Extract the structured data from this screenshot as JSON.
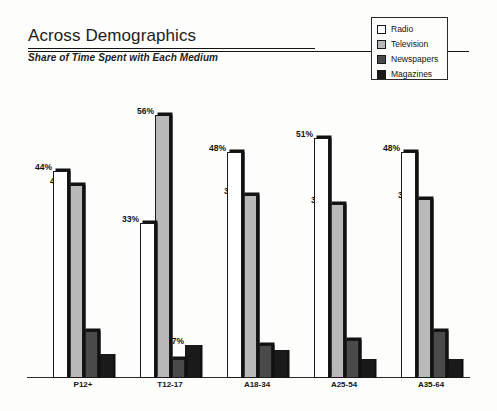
{
  "header": {
    "title": "Across Demographics",
    "subtitle": "Share of Time Spent with Each Medium"
  },
  "legend": {
    "position": "top-right",
    "items": [
      {
        "label": "Radio",
        "color": "#ffffff",
        "name": "legend-swatch-radio"
      },
      {
        "label": "Television",
        "color": "#b9b9b9",
        "name": "legend-swatch-television"
      },
      {
        "label": "Newspapers",
        "color": "#4a4a4a",
        "name": "legend-swatch-newspapers"
      },
      {
        "label": "Magazines",
        "color": "#1a1a1a",
        "name": "legend-swatch-magazines"
      }
    ]
  },
  "chart_data": {
    "type": "bar",
    "title": "Across Demographics",
    "subtitle": "Share of Time Spent with Each Medium",
    "xlabel": "",
    "ylabel": "",
    "ylim": [
      0,
      60
    ],
    "grid": false,
    "legend_position": "top-right",
    "value_suffix": "%",
    "categories": [
      "P12+",
      "T12-17",
      "A18-34",
      "A25-54",
      "A35-64"
    ],
    "series": [
      {
        "name": "Radio",
        "color": "#ffffff",
        "values": [
          44,
          33,
          48,
          51,
          48
        ],
        "labels": [
          "44%",
          "33%",
          "48%",
          "51%",
          "48%"
        ]
      },
      {
        "name": "Television",
        "color": "#b9b9b9",
        "values": [
          41,
          56,
          39,
          37,
          38
        ],
        "labels": [
          "41%",
          "56%",
          "39%",
          "37%",
          "38%"
        ]
      },
      {
        "name": "Newspapers",
        "color": "#4a4a4a",
        "values": [
          10,
          4,
          7,
          8,
          10
        ],
        "labels": [
          "10%",
          "4%",
          "7%",
          "8%",
          "10%"
        ]
      },
      {
        "name": "Magazines",
        "color": "#1a1a1a",
        "values": [
          5,
          7,
          6,
          4,
          4
        ],
        "labels": [
          "5%",
          "7%",
          "6%",
          "4%",
          "4%"
        ]
      }
    ]
  }
}
